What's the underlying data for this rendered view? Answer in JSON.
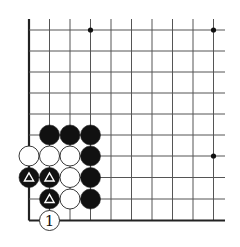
{
  "diagram": {
    "type": "go-board-fragment",
    "colors": {
      "background": "#ffffff",
      "line": "#555555",
      "edge": "#222222",
      "black": "#111111",
      "white": "#ffffff",
      "star": "#111111"
    },
    "grid": {
      "x": [
        29,
        49.5,
        70,
        90.5,
        111,
        131.5,
        152,
        172.5,
        193,
        213.5
      ],
      "y": [
        30,
        51,
        72,
        93,
        114,
        135,
        156,
        177.5,
        199,
        220.5
      ],
      "right_extend": 225,
      "top_extend": 19,
      "left_edge": true,
      "bottom_edge": true
    },
    "star_points": [
      {
        "col": 3,
        "row": 0
      },
      {
        "col": 9,
        "row": 0
      },
      {
        "col": 9,
        "row": 6
      }
    ],
    "stones": [
      {
        "col": 1,
        "row": 5,
        "color": "black"
      },
      {
        "col": 2,
        "row": 5,
        "color": "black"
      },
      {
        "col": 3,
        "row": 5,
        "color": "black"
      },
      {
        "col": 0,
        "row": 6,
        "color": "white"
      },
      {
        "col": 1,
        "row": 6,
        "color": "white"
      },
      {
        "col": 2,
        "row": 6,
        "color": "white"
      },
      {
        "col": 3,
        "row": 6,
        "color": "black"
      },
      {
        "col": 0,
        "row": 7,
        "color": "black",
        "mark": "triangle"
      },
      {
        "col": 1,
        "row": 7,
        "color": "black",
        "mark": "triangle"
      },
      {
        "col": 2,
        "row": 7,
        "color": "white"
      },
      {
        "col": 3,
        "row": 7,
        "color": "black"
      },
      {
        "col": 1,
        "row": 8,
        "color": "black",
        "mark": "triangle"
      },
      {
        "col": 2,
        "row": 8,
        "color": "white"
      },
      {
        "col": 3,
        "row": 8,
        "color": "black"
      },
      {
        "col": 1,
        "row": 9,
        "color": "white",
        "label": "1"
      }
    ]
  }
}
